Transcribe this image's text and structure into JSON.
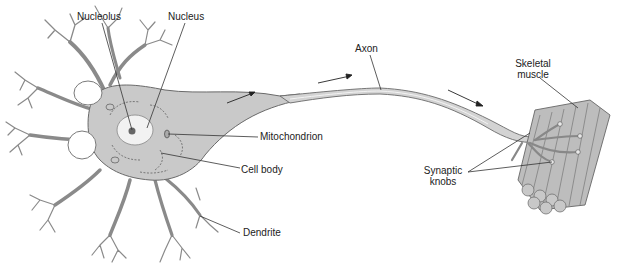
{
  "figure": {
    "type": "labeled diagram",
    "labels": {
      "nucleolus": "Nucleolus",
      "nucleus": "Nucleus",
      "axon": "Axon",
      "skeletal_muscle_line1": "Skeletal",
      "skeletal_muscle_line2": "muscle",
      "mitochondrion": "Mitochondrion",
      "cell_body": "Cell body",
      "synaptic_knobs_line1": "Synaptic",
      "synaptic_knobs_line2": "knobs",
      "dendrite": "Dendrite"
    },
    "arrows": [
      "signal-direction-arrow-1",
      "signal-direction-arrow-2",
      "signal-direction-arrow-3"
    ],
    "colors": {
      "tissue": "#c9c9c9",
      "tissue_outline": "#6a6a6a",
      "nucleus": "#f2f2f2",
      "leader_line": "#333333"
    }
  }
}
